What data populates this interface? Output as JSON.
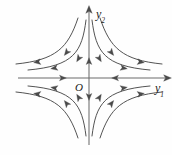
{
  "figure": {
    "type": "phase-portrait",
    "name": "saddle-point-phase-portrait",
    "background_color": "#fefefe",
    "stroke_color": "#4a4a4a",
    "axis_color": "#6b6b6b",
    "text_color": "#1a1a1a",
    "width": 172,
    "height": 155
  },
  "labels": {
    "y_axis": {
      "base": "y",
      "sub": "2",
      "full": "y2"
    },
    "x_axis": {
      "base": "y",
      "sub": "1",
      "full": "y1"
    },
    "origin": "O"
  },
  "chart_data": {
    "type": "line",
    "title": "",
    "xlabel": "y1",
    "ylabel": "y2",
    "xlim": [
      -1,
      1
    ],
    "ylim": [
      -1,
      1
    ],
    "grid": false,
    "legend": null,
    "origin": {
      "x": 89,
      "y": 78,
      "label": "O"
    },
    "axes": [
      {
        "name": "y1-axis",
        "orientation": "horizontal",
        "x1": 18,
        "y1": 78,
        "x2": 165,
        "y2": 78,
        "tip_arrow": "right",
        "flow_arrows": [
          {
            "x": 62,
            "y": 78,
            "direction": "right"
          },
          {
            "x": 116,
            "y": 78,
            "direction": "left"
          }
        ],
        "manifold": "stable"
      },
      {
        "name": "y2-axis",
        "orientation": "vertical",
        "x1": 89,
        "y1": 145,
        "x2": 89,
        "y2": 12,
        "tip_arrow": "up",
        "flow_arrows": [
          {
            "x": 89,
            "y": 62,
            "direction": "up"
          },
          {
            "x": 89,
            "y": 96,
            "direction": "down"
          }
        ],
        "manifold": "unstable"
      }
    ],
    "series": [
      {
        "name": "trajectory-q1-inner",
        "quadrant": "upper-right",
        "path": "M 92 20 C 96 52, 104 66, 150 70",
        "arrows": [
          {
            "x": 99,
            "y": 58,
            "angle": 58
          },
          {
            "x": 123,
            "y": 68,
            "angle": 10
          }
        ]
      },
      {
        "name": "trajectory-q1-outer",
        "quadrant": "upper-right",
        "path": "M 100 18 C 110 48, 122 60, 162 64",
        "arrows": [
          {
            "x": 111,
            "y": 52,
            "angle": 52
          },
          {
            "x": 140,
            "y": 62,
            "angle": 8
          }
        ]
      },
      {
        "name": "trajectory-q2-inner",
        "quadrant": "upper-left",
        "path": "M 86 20 C 82 52, 74 66, 28 70",
        "arrows": [
          {
            "x": 79,
            "y": 58,
            "angle": 122
          },
          {
            "x": 55,
            "y": 68,
            "angle": 170
          }
        ]
      },
      {
        "name": "trajectory-q2-outer",
        "quadrant": "upper-left",
        "path": "M 78 18 C 68 48, 56 60, 16 64",
        "arrows": [
          {
            "x": 67,
            "y": 52,
            "angle": 128
          },
          {
            "x": 38,
            "y": 62,
            "angle": 172
          }
        ]
      },
      {
        "name": "trajectory-q3-inner",
        "quadrant": "lower-left",
        "path": "M 86 136 C 82 104, 74 90, 28 86",
        "arrows": [
          {
            "x": 79,
            "y": 98,
            "angle": 238
          },
          {
            "x": 55,
            "y": 88,
            "angle": 190
          }
        ]
      },
      {
        "name": "trajectory-q3-outer",
        "quadrant": "lower-left",
        "path": "M 78 138 C 68 108, 56 96, 16 92",
        "arrows": [
          {
            "x": 67,
            "y": 104,
            "angle": 232
          },
          {
            "x": 38,
            "y": 94,
            "angle": 188
          }
        ]
      },
      {
        "name": "trajectory-q4-inner",
        "quadrant": "lower-right",
        "path": "M 92 136 C 96 104, 104 90, 150 86",
        "arrows": [
          {
            "x": 99,
            "y": 98,
            "angle": 302
          },
          {
            "x": 123,
            "y": 88,
            "angle": 350
          }
        ]
      },
      {
        "name": "trajectory-q4-outer",
        "quadrant": "lower-right",
        "path": "M 100 138 C 110 108, 122 96, 162 92",
        "arrows": [
          {
            "x": 111,
            "y": 104,
            "angle": 308
          },
          {
            "x": 140,
            "y": 94,
            "angle": 352
          }
        ]
      }
    ]
  }
}
